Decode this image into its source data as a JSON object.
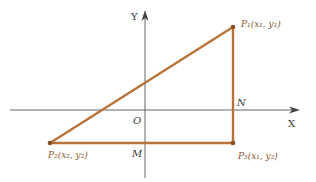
{
  "diagram": {
    "colors": {
      "axis": "#555555",
      "triangle": "#b8733a",
      "label_dark": "#3a3a3a",
      "label_brown": "#8a5a30"
    },
    "axes": {
      "x_label": "X",
      "y_label": "Y",
      "origin_label": "O"
    },
    "points": {
      "P1": {
        "label": "P₁(x₁, y₁)",
        "x": 233,
        "y": 27
      },
      "P2": {
        "label": "P₂(x₂, y₂)",
        "x": 50,
        "y": 143
      },
      "P3": {
        "label": "P₃(x₁, y₂)",
        "x": 233,
        "y": 143
      }
    },
    "markers": {
      "N": "N",
      "M": "M"
    }
  }
}
